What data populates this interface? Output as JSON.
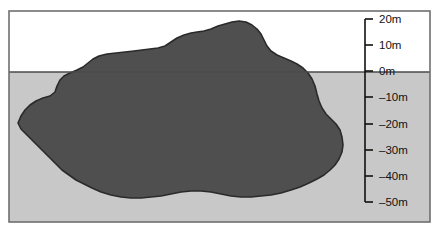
{
  "figure": {
    "name": "island-cross-section",
    "colors": {
      "sky": "#ffffff",
      "water": "#c8c8c8",
      "island": "#4f4f4f",
      "outline": "#2a2a2a",
      "frame": "#6f6f6f",
      "waterline": "#4a4a4a",
      "scale": "#111111",
      "label": "#111111"
    },
    "frame": {
      "x": 9,
      "y": 11,
      "width": 421,
      "height": 211
    },
    "waterline_y": 72
  },
  "depth_scale": {
    "name": "depth-scale",
    "axis_x": 365,
    "top_y": 19,
    "bottom_y": 202,
    "tick_length": 8,
    "label_offset_x": 14,
    "ticks": [
      {
        "label": "20m",
        "value": 20,
        "y": 19
      },
      {
        "label": "10m",
        "value": 10,
        "y": 45
      },
      {
        "label": "0m",
        "value": 0,
        "y": 71
      },
      {
        "label": "–10m",
        "value": -10,
        "y": 97
      },
      {
        "label": "–20m",
        "value": -20,
        "y": 124
      },
      {
        "label": "–30m",
        "value": -30,
        "y": 150
      },
      {
        "label": "–40m",
        "value": -40,
        "y": 176
      },
      {
        "label": "–50m",
        "value": -50,
        "y": 202
      }
    ]
  },
  "chart_data": {
    "type": "area",
    "title": "",
    "xlabel": "",
    "ylabel": "Depth",
    "ylim": [
      -50,
      20
    ],
    "grid": false,
    "legend": null,
    "series": [
      {
        "name": "island-profile",
        "description": "Cross-sectional silhouette of an island; portion above 0m is land, portion below 0m is submerged.",
        "polygon": "18,123 21,116 25,110 30,105 36,101 43,98 50,96 55,92 57,86 60,80 64,76 70,73 77,70 83,67 88,63 93,59 99,56 107,54 116,53 125,52 134,51 142,50 150,49 158,48 165,46 171,42 177,38 184,35 191,33 197,32 204,31 211,29 218,26 225,24 232,22 239,21 246,22 252,25 257,29 261,34 264,40 267,46 271,51 277,55 284,58 291,61 297,64 303,68 308,73 312,79 315,86 317,94 319,101 322,108 326,114 331,119 336,124 340,130 342,137 343,145 342,152 339,159 335,165 330,170 324,175 317,179 309,183 300,187 291,190 281,193 271,195 261,196 251,197 241,197 231,196 221,194 211,192 201,191 191,191 181,192 171,194 161,196 151,197 141,198 131,198 121,197 111,195 101,192 92,188 84,184 76,180 69,175 62,170 56,164 50,158 44,152 38,146 32,140 26,134 21,129"
      }
    ]
  }
}
